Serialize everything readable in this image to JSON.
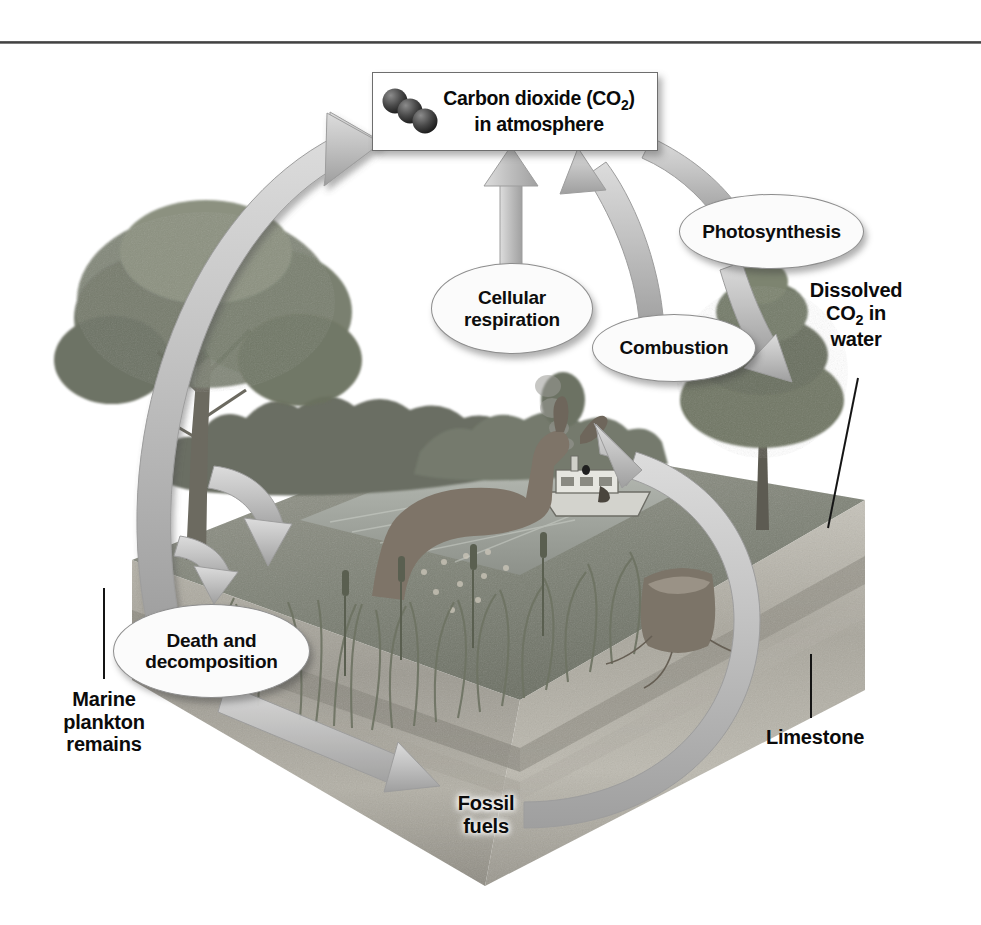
{
  "figure": {
    "type": "cycle-diagram"
  },
  "co2_box": {
    "line1": "Carbon dioxide (CO",
    "sub": "2",
    "line1_end": ")",
    "line2": "in atmosphere",
    "molecule_icon": "co2-molecule-icon"
  },
  "process_labels": [
    {
      "id": "cellular-respiration",
      "line1": "Cellular",
      "line2": "respiration",
      "shape": "ellipse"
    },
    {
      "id": "combustion",
      "line1": "Combustion",
      "line2": "",
      "shape": "ellipse"
    },
    {
      "id": "photosynthesis",
      "line1": "Photosynthesis",
      "line2": "",
      "shape": "ellipse"
    },
    {
      "id": "death-and-decomposition",
      "line1": "Death and",
      "line2": "decomposition",
      "shape": "ellipse"
    }
  ],
  "reservoir_labels": [
    {
      "id": "dissolved-co2",
      "line1": "Dissolved",
      "line2a": "CO",
      "sub": "2",
      "line2b": " in",
      "line3": "water",
      "leader": true
    },
    {
      "id": "marine-plankton-remains",
      "line1": "Marine",
      "line2": "plankton",
      "line3": "remains",
      "leader": true
    },
    {
      "id": "limestone",
      "line1": "Limestone",
      "leader": true
    },
    {
      "id": "fossil-fuels",
      "line1": "Fossil",
      "line2": "fuels",
      "leader": false
    }
  ],
  "arrows": [
    {
      "id": "decomposition-to-atmosphere",
      "from": "death-and-decomposition",
      "to": "co2-box",
      "style": "wide-curve-up-left"
    },
    {
      "id": "respiration-to-atmosphere",
      "from": "cellular-respiration",
      "to": "co2-box",
      "style": "straight-up"
    },
    {
      "id": "combustion-to-atmosphere",
      "from": "combustion",
      "to": "co2-box",
      "style": "curve-up"
    },
    {
      "id": "atmosphere-to-photosynthesis",
      "from": "co2-box",
      "to": "dissolved-co2",
      "style": "curve-down-right"
    },
    {
      "id": "organisms-to-decomposition",
      "from": "biomass",
      "to": "death-and-decomposition",
      "style": "hook-down"
    },
    {
      "id": "decomposition-to-fossil-fuels",
      "from": "death-and-decomposition",
      "to": "fossil-fuels",
      "style": "diagonal-down-right"
    },
    {
      "id": "fossil-fuels-to-combustion",
      "from": "fossil-fuels",
      "to": "combustion",
      "style": "large-circular-right"
    }
  ],
  "colors": {
    "arrow_fill": "#b9b9b9",
    "arrow_stroke": "#8f8f8f",
    "ellipse_fill": "#fbfbfb",
    "ellipse_stroke": "#8d8d8d",
    "text": "#0d0d0d",
    "rule": "#3a3a3a",
    "ground_top": "#8e8e86",
    "ground_side": "#a9a9a2",
    "water": "#9a9d98",
    "sky": "#ffffff"
  }
}
